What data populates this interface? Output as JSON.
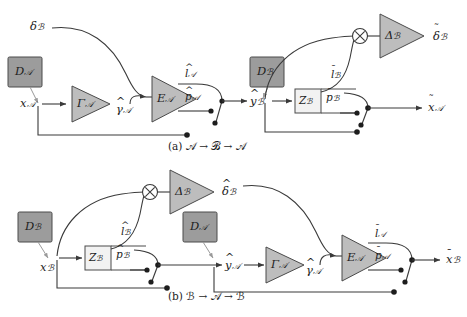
{
  "figure": {
    "colors": {
      "stroke": "#3a3a3a",
      "dark_box_fill": "#9c9c9c",
      "light_box_fill": "#f2f2f2",
      "triangle_fill": "#bdbdbd",
      "text": "#1d1d1d"
    }
  },
  "captions": {
    "a": "(a) 𝒜 → ℬ → 𝒜",
    "b": "(b) ℬ → 𝒜 → ℬ"
  },
  "row_a": {
    "input_label": {
      "base": "x",
      "mark": "",
      "sub": "𝒜"
    },
    "delta_in": {
      "base": "δ",
      "mark": "",
      "sub": "ℬ"
    },
    "box_da": {
      "base": "D",
      "mark": "",
      "sub": "𝒜"
    },
    "tri_gamma": {
      "base": "Γ",
      "mark": "",
      "sub": "𝒜"
    },
    "gamma_hat": {
      "base": "γ",
      "mark": "hat",
      "sub": "𝒜"
    },
    "tri_ea": {
      "base": "E",
      "mark": "",
      "sub": "𝒜"
    },
    "l_hat": {
      "base": "l",
      "mark": "hat",
      "sub": "𝒜"
    },
    "p_hat": {
      "base": "p",
      "mark": "hat",
      "sub": "𝒜"
    },
    "y_hat": {
      "base": "y",
      "mark": "hat",
      "sub": "ℬ"
    },
    "box_db": {
      "base": "D",
      "mark": "",
      "sub": "ℬ"
    },
    "box_zb": {
      "base": "Z",
      "mark": "",
      "sub": "ℬ"
    },
    "l_bar": {
      "base": "l",
      "mark": "bar",
      "sub": "ℬ"
    },
    "p_bar": {
      "base": "p",
      "mark": "bar",
      "sub": "ℬ"
    },
    "cross": "⊗",
    "tri_delta": {
      "base": "Δ",
      "mark": "",
      "sub": "ℬ"
    },
    "delta_out": {
      "base": "δ",
      "mark": "til",
      "sub": "ℬ"
    },
    "output_label": {
      "base": "x",
      "mark": "til",
      "sub": "𝒜"
    }
  },
  "row_b": {
    "input_label": {
      "base": "x",
      "mark": "",
      "sub": "ℬ"
    },
    "box_db": {
      "base": "D",
      "mark": "",
      "sub": "ℬ"
    },
    "box_zb": {
      "base": "Z",
      "mark": "",
      "sub": "ℬ"
    },
    "l_hat": {
      "base": "l",
      "mark": "hat",
      "sub": "ℬ"
    },
    "p_hat": {
      "base": "p",
      "mark": "hat",
      "sub": "ℬ"
    },
    "cross": "⊗",
    "tri_delta": {
      "base": "Δ",
      "mark": "",
      "sub": "ℬ"
    },
    "delta_out": {
      "base": "δ",
      "mark": "hat",
      "sub": "ℬ"
    },
    "box_da": {
      "base": "D",
      "mark": "",
      "sub": "𝒜"
    },
    "y_hat": {
      "base": "y",
      "mark": "hat",
      "sub": "𝒜"
    },
    "tri_gamma": {
      "base": "Γ",
      "mark": "",
      "sub": "𝒜"
    },
    "gamma_hat": {
      "base": "γ",
      "mark": "hat",
      "sub": "𝒜"
    },
    "tri_ea": {
      "base": "E",
      "mark": "",
      "sub": "𝒜"
    },
    "l_bar": {
      "base": "l",
      "mark": "bar",
      "sub": "𝒜"
    },
    "p_bar": {
      "base": "p",
      "mark": "bar",
      "sub": "𝒜"
    },
    "output_label": {
      "base": "x",
      "mark": "bar",
      "sub": "ℬ"
    }
  }
}
